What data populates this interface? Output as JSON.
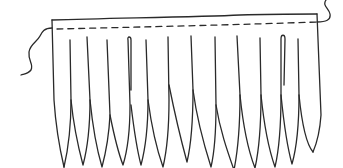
{
  "illustration": {
    "subject": "fringe-trim",
    "stroke_color": "#2a2a2a",
    "background": "#ffffff",
    "strand_count": 13,
    "tip_x": [
      64,
      83,
      102,
      123,
      141,
      163,
      187,
      211,
      234,
      255,
      275,
      292,
      313
    ]
  }
}
